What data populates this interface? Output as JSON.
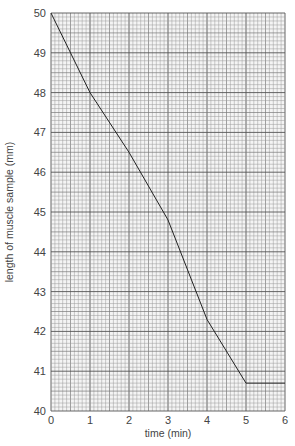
{
  "chart_data": {
    "type": "line",
    "title": "",
    "xlabel": "time (min)",
    "ylabel": "length of muscle sample (mm)",
    "x": [
      0,
      1,
      2,
      3,
      4,
      5,
      6
    ],
    "series": [
      {
        "name": "muscle length",
        "values": [
          50,
          48.0,
          46.5,
          44.8,
          42.3,
          40.7,
          40.7
        ]
      }
    ],
    "xlim": [
      0,
      6
    ],
    "ylim": [
      40,
      50
    ],
    "xticks": [
      "0",
      "1",
      "2",
      "3",
      "4",
      "5",
      "6"
    ],
    "yticks": [
      "40",
      "41",
      "42",
      "43",
      "44",
      "45",
      "46",
      "47",
      "48",
      "49",
      "50"
    ],
    "grid": true,
    "legend": null
  },
  "colors": {
    "line": "#222222",
    "grid_minor": "#9a9a9a",
    "grid_major": "#555555",
    "text": "#444444"
  }
}
